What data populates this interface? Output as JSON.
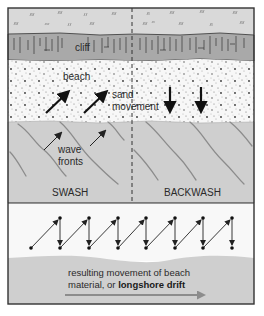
{
  "figure": {
    "type": "cross-section diagram",
    "topic": "swash, backwash and longshore drift"
  },
  "top_panel": {
    "layers": [
      {
        "name": "land-surface",
        "color": "#d9d9d9"
      },
      {
        "name": "cliff",
        "color": "#a9a9a9"
      },
      {
        "name": "beach",
        "color": "#f7f7f7"
      },
      {
        "name": "sea",
        "color": "#cfcfcf"
      }
    ],
    "labels": {
      "cliff": "cliff",
      "beach": "beach",
      "sand_movement_1": "sand",
      "sand_movement_2": "movement",
      "wave_fronts_1": "wave",
      "wave_fronts_2": "fronts",
      "swash": "SWASH",
      "backwash": "BACKWASH"
    },
    "arrows": {
      "swash_sand": "diagonal up-right (onshore)",
      "backwash_sand": "straight down (offshore)",
      "wave_fronts": "diagonal up-right"
    }
  },
  "bottom_panel": {
    "zigzag": {
      "description": "particle path: diagonal swash up, vertical backwash down",
      "steps": 7
    },
    "caption_line1": "resulting movement of beach",
    "caption_line2_plain": "material, or ",
    "caption_line2_bold": "longshore drift",
    "arrow_direction": "right"
  },
  "colors": {
    "frame": "#3a3a3a",
    "sea": "#cfcfcf",
    "land": "#d9d9d9",
    "cliff": "#a9a9a9",
    "beach": "#f7f7f7",
    "wave_line": "#8c8c8c",
    "drift_arrow": "#8c8c8c"
  }
}
